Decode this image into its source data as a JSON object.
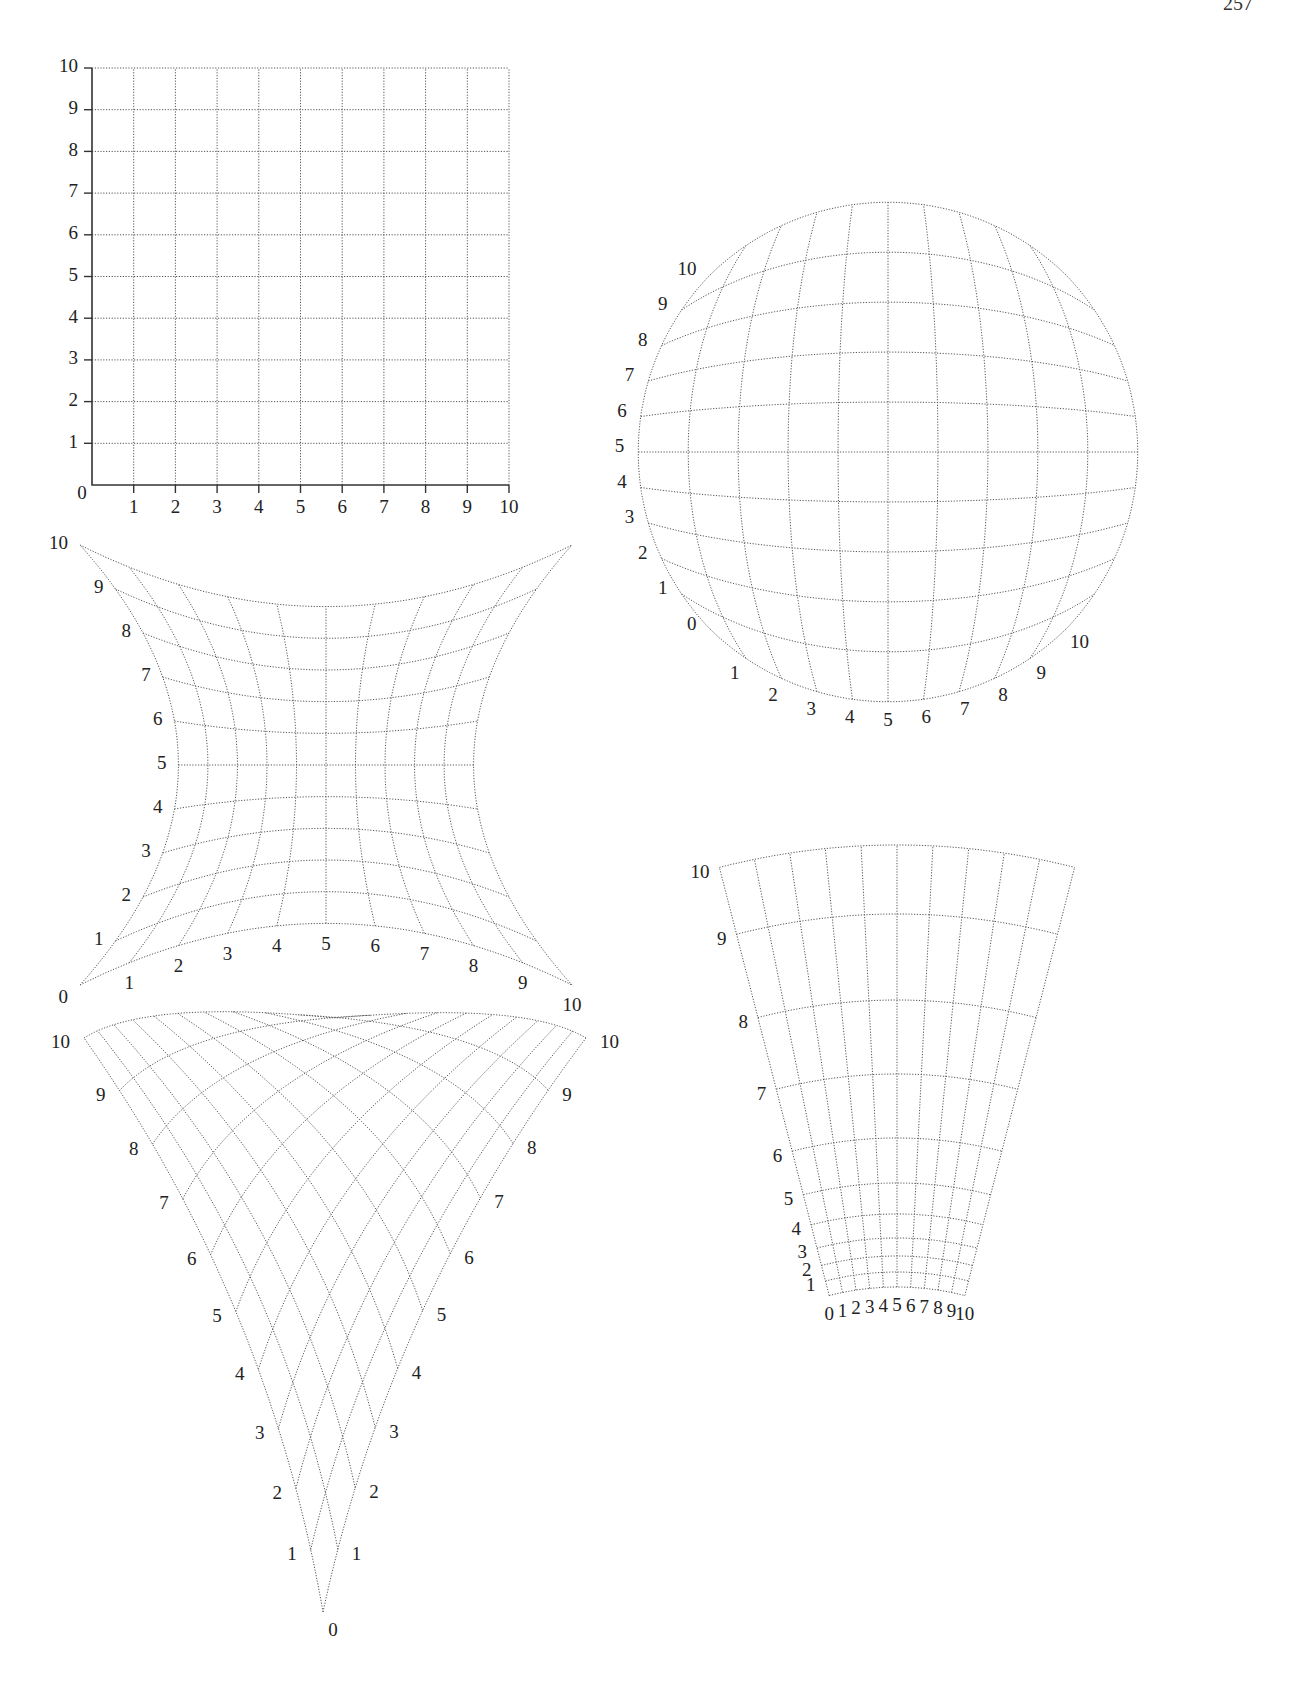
{
  "page": {
    "number": "257"
  },
  "grids": {
    "square": {
      "name": "square-cartesian-grid",
      "origin_label": "0",
      "x_labels": [
        "1",
        "2",
        "3",
        "4",
        "5",
        "6",
        "7",
        "8",
        "9",
        "10"
      ],
      "y_labels": [
        "1",
        "2",
        "3",
        "4",
        "5",
        "6",
        "7",
        "8",
        "9",
        "10"
      ]
    },
    "circle": {
      "name": "spherical-bulge-grid",
      "left_labels": [
        "0",
        "1",
        "2",
        "3",
        "4",
        "5",
        "6",
        "7",
        "8",
        "9",
        "10"
      ],
      "bottom_labels": [
        "1",
        "2",
        "3",
        "4",
        "5",
        "6",
        "7",
        "8",
        "9",
        "10"
      ]
    },
    "pinch": {
      "name": "pinched-concave-grid",
      "left_labels": [
        "0",
        "1",
        "2",
        "3",
        "4",
        "5",
        "6",
        "7",
        "8",
        "9",
        "10"
      ],
      "bottom_labels": [
        "1",
        "2",
        "3",
        "4",
        "5",
        "6",
        "7",
        "8",
        "9",
        "10"
      ]
    },
    "vshape": {
      "name": "v-shaped-curved-grid",
      "bottom_label": "0",
      "left_labels": [
        "1",
        "2",
        "3",
        "4",
        "5",
        "6",
        "7",
        "8",
        "9",
        "10"
      ],
      "right_labels": [
        "1",
        "2",
        "3",
        "4",
        "5",
        "6",
        "7",
        "8",
        "9",
        "10"
      ]
    },
    "fan": {
      "name": "fan-perspective-grid",
      "left_labels": [
        "1",
        "2",
        "3",
        "4",
        "5",
        "6",
        "7",
        "8",
        "9",
        "10"
      ],
      "bottom_labels": [
        "0",
        "1",
        "2",
        "3",
        "4",
        "5",
        "6",
        "7",
        "8",
        "9",
        "10"
      ]
    }
  }
}
